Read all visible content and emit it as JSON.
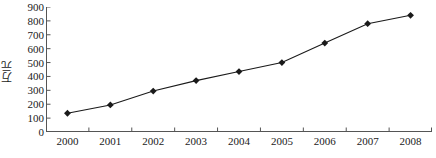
{
  "chart_data": {
    "type": "line",
    "title": "",
    "subtitle": "",
    "xlabel": "",
    "ylabel": "万元",
    "categories": [
      "2000",
      "2001",
      "2002",
      "2003",
      "2004",
      "2005",
      "2006",
      "2007",
      "2008"
    ],
    "values": [
      135,
      195,
      295,
      370,
      435,
      500,
      640,
      780,
      840
    ],
    "series": [
      {
        "name": "",
        "values": [
          135,
          195,
          295,
          370,
          435,
          500,
          640,
          780,
          840
        ]
      }
    ],
    "ylim": [
      0,
      900
    ],
    "ytick_values": [
      0,
      100,
      200,
      300,
      400,
      500,
      600,
      700,
      800,
      900
    ],
    "ytick_labels": [
      "0",
      "100",
      "200",
      "300",
      "400",
      "500",
      "600",
      "700",
      "800",
      "900"
    ],
    "xtick_labels": [
      "2000",
      "2001",
      "2002",
      "2003",
      "2004",
      "2005",
      "2006",
      "2007",
      "2008"
    ],
    "grid": false,
    "legend": false,
    "legend_position": "none",
    "marker": "diamond",
    "line_color": "#1a1a1a",
    "marker_color": "#1a1a1a",
    "background_color": "#ffffff",
    "axis_color": "#555555",
    "annotations": []
  }
}
